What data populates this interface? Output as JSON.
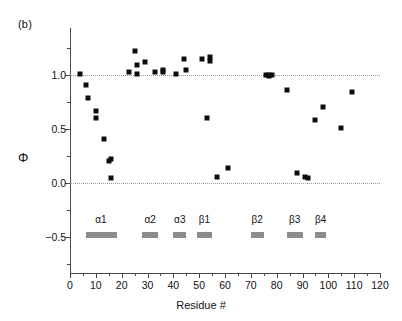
{
  "panel": {
    "label": "(b)"
  },
  "axes": {
    "ylabel": "Φ",
    "xlabel": "Residue #",
    "y_ticks": [
      "1.0",
      "0.5",
      "0.0",
      "−0.5"
    ],
    "x_ticks": [
      "0",
      "10",
      "20",
      "30",
      "40",
      "50",
      "60",
      "70",
      "80",
      "90",
      "100",
      "110",
      "120"
    ]
  },
  "chart_data": {
    "type": "scatter",
    "title": "",
    "xlabel": "Residue #",
    "ylabel": "Φ",
    "xlim": [
      0,
      120
    ],
    "ylim": [
      -0.78,
      1.32
    ],
    "grid": "horizontal dotted gridlines at y = 1.0 and y = 0.0",
    "legend": "none",
    "marker": "filled black square",
    "series": [
      {
        "name": "Φ values",
        "points": [
          {
            "x": 4,
            "y": 1.01
          },
          {
            "x": 6,
            "y": 0.91
          },
          {
            "x": 7,
            "y": 0.79
          },
          {
            "x": 10,
            "y": 0.67
          },
          {
            "x": 10,
            "y": 0.6
          },
          {
            "x": 13,
            "y": 0.41
          },
          {
            "x": 15,
            "y": 0.2
          },
          {
            "x": 16,
            "y": 0.22
          },
          {
            "x": 16,
            "y": 0.05
          },
          {
            "x": 23,
            "y": 1.03
          },
          {
            "x": 25,
            "y": 1.22
          },
          {
            "x": 26,
            "y": 1.09
          },
          {
            "x": 26,
            "y": 1.01
          },
          {
            "x": 29,
            "y": 1.12
          },
          {
            "x": 33,
            "y": 1.03
          },
          {
            "x": 36,
            "y": 1.03
          },
          {
            "x": 36,
            "y": 1.05
          },
          {
            "x": 41,
            "y": 1.01
          },
          {
            "x": 44,
            "y": 1.15
          },
          {
            "x": 45,
            "y": 1.05
          },
          {
            "x": 51,
            "y": 1.15
          },
          {
            "x": 53,
            "y": 0.6
          },
          {
            "x": 54,
            "y": 1.17
          },
          {
            "x": 54,
            "y": 1.13
          },
          {
            "x": 57,
            "y": 0.06
          },
          {
            "x": 61,
            "y": 0.14
          },
          {
            "x": 76,
            "y": 1.0
          },
          {
            "x": 77,
            "y": 1.0
          },
          {
            "x": 77,
            "y": 0.99
          },
          {
            "x": 78,
            "y": 1.0
          },
          {
            "x": 84,
            "y": 0.86
          },
          {
            "x": 88,
            "y": 0.09
          },
          {
            "x": 91,
            "y": 0.06
          },
          {
            "x": 92,
            "y": 0.05
          },
          {
            "x": 95,
            "y": 0.58
          },
          {
            "x": 98,
            "y": 0.7
          },
          {
            "x": 105,
            "y": 0.51
          },
          {
            "x": 109,
            "y": 0.84
          }
        ]
      }
    ],
    "annotations": {
      "panel_label": "(b)",
      "secondary_structure": [
        {
          "label": "α1",
          "start": 6,
          "end": 18
        },
        {
          "label": "α2",
          "start": 28,
          "end": 34
        },
        {
          "label": "α3",
          "start": 40,
          "end": 45
        },
        {
          "label": "β1",
          "start": 49,
          "end": 55
        },
        {
          "label": "β2",
          "start": 70,
          "end": 75
        },
        {
          "label": "β3",
          "start": 84,
          "end": 90
        },
        {
          "label": "β4",
          "start": 95,
          "end": 99
        }
      ]
    }
  }
}
